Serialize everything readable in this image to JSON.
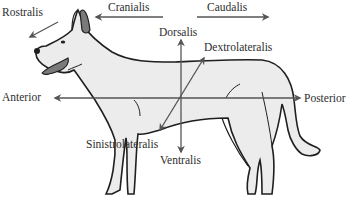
{
  "diagram": {
    "colors": {
      "outline": "#1f1f1f",
      "body_fill": "#ececec",
      "arrow": "#555555",
      "ear_tongue_fill": "#7a7a7a",
      "text": "#2e2e2e"
    },
    "labels": {
      "rostralis": "Rostralis",
      "cranialis": "Cranialis",
      "caudalis": "Caudalis",
      "dorsalis": "Dorsalis",
      "dextrolateralis": "Dextrolateralis",
      "anterior": "Anterior",
      "posterior": "Posterior",
      "sinistrolateralis": "Sinistrolateralis",
      "ventralis": "Ventralis"
    },
    "arrows": [
      {
        "name": "rostralis",
        "direction": "down-left"
      },
      {
        "name": "cranialis",
        "direction": "left"
      },
      {
        "name": "caudalis",
        "direction": "right"
      },
      {
        "name": "dorsalis",
        "direction": "up"
      },
      {
        "name": "ventralis",
        "direction": "down"
      },
      {
        "name": "anterior",
        "direction": "left"
      },
      {
        "name": "posterior",
        "direction": "right"
      },
      {
        "name": "dextrolateralis",
        "direction": "up-right"
      },
      {
        "name": "sinistrolateralis",
        "direction": "down-left"
      }
    ]
  }
}
